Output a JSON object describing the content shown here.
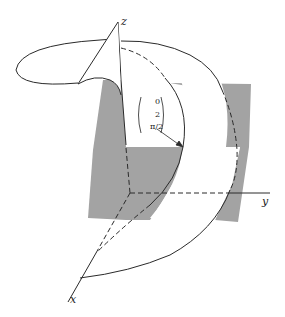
{
  "diagram": {
    "type": "3d-surface-figure",
    "axes": {
      "x_label": "x",
      "y_label": "y",
      "z_label": "z"
    },
    "point_label": {
      "components": [
        "0",
        "2",
        "π/2"
      ]
    },
    "colors": {
      "shaded_plane": "#a3a3a3",
      "line": "#2a2a2a",
      "background": "#ffffff"
    }
  }
}
